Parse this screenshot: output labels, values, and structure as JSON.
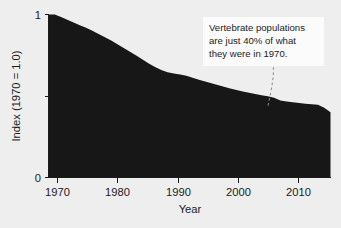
{
  "chart_data": {
    "type": "area",
    "title": "",
    "subtitle": "",
    "xlabel": "Year",
    "ylabel": "Index (1970 = 1.0)",
    "xlim": [
      1969,
      2014
    ],
    "ylim": [
      0,
      1
    ],
    "grid": false,
    "legend": null,
    "legend_position": "none",
    "x_ticks": [
      1970,
      1980,
      1990,
      2000,
      2010
    ],
    "x_tick_labels": [
      "1970",
      "1980",
      "1990",
      "2000",
      "2010"
    ],
    "y_ticks": [
      0,
      0.5,
      1
    ],
    "y_tick_labels": [
      "0",
      "",
      "1"
    ],
    "series": [
      {
        "name": "Living Planet Index",
        "color": "#171717",
        "x": [
          1969,
          1970,
          1971,
          1972,
          1973,
          1974,
          1975,
          1976,
          1977,
          1978,
          1979,
          1980,
          1981,
          1982,
          1983,
          1984,
          1985,
          1986,
          1987,
          1988,
          1989,
          1990,
          1991,
          1992,
          1993,
          1994,
          1995,
          1996,
          1997,
          1998,
          1999,
          2000,
          2001,
          2002,
          2003,
          2004,
          2005,
          2006,
          2007,
          2008,
          2009,
          2010,
          2011,
          2012,
          2013,
          2014
        ],
        "values": [
          1.0,
          1.0,
          0.985,
          0.968,
          0.951,
          0.934,
          0.918,
          0.9,
          0.881,
          0.861,
          0.84,
          0.818,
          0.795,
          0.772,
          0.748,
          0.724,
          0.7,
          0.678,
          0.66,
          0.646,
          0.638,
          0.632,
          0.624,
          0.612,
          0.6,
          0.589,
          0.578,
          0.567,
          0.556,
          0.546,
          0.537,
          0.528,
          0.52,
          0.512,
          0.505,
          0.498,
          0.49,
          0.473,
          0.466,
          0.461,
          0.457,
          0.453,
          0.449,
          0.446,
          0.428,
          0.4
        ]
      }
    ],
    "annotations": [
      {
        "name": "vertebrate-decline-note",
        "lines": [
          "Vertebrate populations",
          "are just 40% of what",
          "they were in 1970."
        ],
        "leader_from": [
          2006,
          0.78
        ],
        "leader_to": [
          2004,
          0.44
        ]
      }
    ]
  },
  "colors": {
    "background": "#eeeeee",
    "area": "#171717",
    "axis": "#1a1a1a",
    "text": "#1c1c1c",
    "annotation_background": "#fbfbfb",
    "leader": "#8d8d8d"
  }
}
